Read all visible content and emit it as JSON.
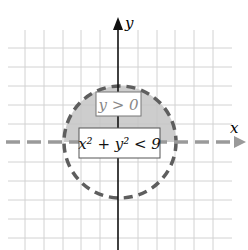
{
  "diagram": {
    "axes": {
      "x_label": "x",
      "y_label": "y"
    },
    "region_labels": {
      "upper": "y > 0",
      "circle": "x² + y² < 9"
    },
    "circle": {
      "radius": 3,
      "boundary": "dashed"
    },
    "shaded_region": "upper half of disk (y > 0 and x² + y² < 9)",
    "colors": {
      "shade": "#bdbdbd",
      "dashed": "#5a5a5a",
      "grid": "#cfcfcf",
      "axis": "#111111"
    }
  }
}
